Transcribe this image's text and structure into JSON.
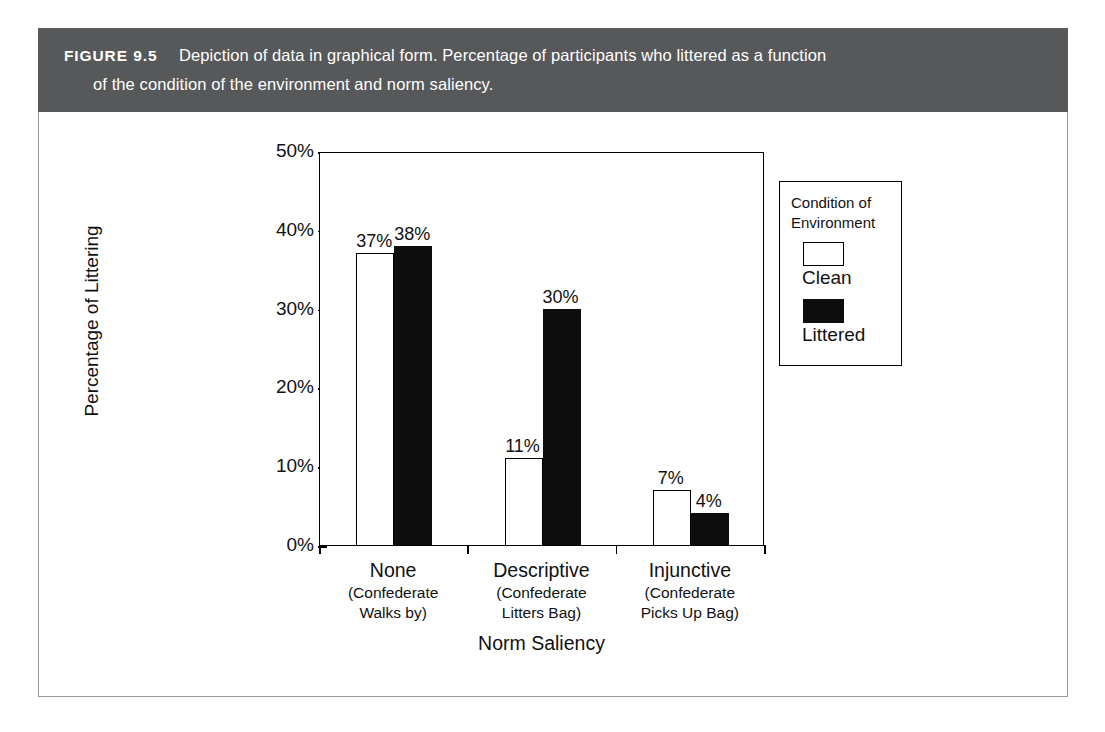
{
  "figure": {
    "label": "FIGURE 9.5",
    "caption_line_1": "Depiction of data in graphical form. Percentage of participants who littered as a function",
    "caption_line_2": "of the condition of the environment and norm saliency.",
    "header_bg": "#57585a",
    "header_text_color": "#ffffff"
  },
  "chart_data": {
    "type": "bar",
    "title": "",
    "xlabel": "Norm Saliency",
    "ylabel": "Percentage of Littering",
    "ylim": [
      0,
      50
    ],
    "yticks": [
      "0%",
      "10%",
      "20%",
      "30%",
      "40%",
      "50%"
    ],
    "ytick_values": [
      0,
      10,
      20,
      30,
      40,
      50
    ],
    "grid": false,
    "legend_position": "right-outside",
    "legend_title": "Condition of Environment",
    "categories": [
      "None",
      "Descriptive",
      "Injunctive"
    ],
    "category_sublabels": [
      [
        "(Confederate",
        "Walks by)"
      ],
      [
        "(Confederate",
        "Litters Bag)"
      ],
      [
        "(Confederate",
        "Picks Up Bag)"
      ]
    ],
    "series": [
      {
        "name": "Clean",
        "color": "#ffffff",
        "edge_color": "#000000",
        "values": [
          37,
          11,
          7
        ],
        "labels": [
          "37%",
          "11%",
          "7%"
        ]
      },
      {
        "name": "Littered",
        "color": "#0d0d0d",
        "edge_color": "#0d0d0d",
        "values": [
          38,
          30,
          4
        ],
        "labels": [
          "38%",
          "30%",
          "4%"
        ]
      }
    ]
  },
  "legend": {
    "title_line_1": "Condition of",
    "title_line_2": "Environment",
    "entries": [
      {
        "label": "Clean",
        "swatch": "clean"
      },
      {
        "label": "Littered",
        "swatch": "littered"
      }
    ]
  }
}
